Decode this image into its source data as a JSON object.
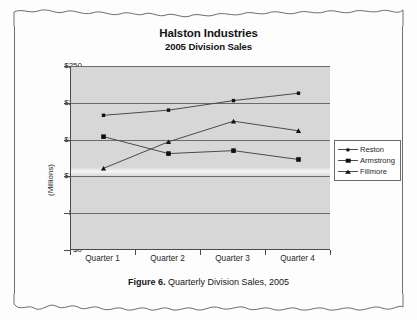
{
  "document": {
    "caption_label": "Figure 6.",
    "caption_text": "Quarterly Division Sales, 2005"
  },
  "chart_data": {
    "type": "line",
    "title": "Halston Industries",
    "subtitle": "2005 Division Sales",
    "xlabel": "",
    "ylabel": "(Millions)",
    "categories": [
      "Quarter 1",
      "Quarter 2",
      "Quarter 3",
      "Quarter 4"
    ],
    "ylim": [
      0,
      250
    ],
    "yticks": [
      0,
      50,
      100,
      150,
      200,
      250
    ],
    "ytick_labels": [
      "$0",
      "$50",
      "$100",
      "$150",
      "$200",
      "$250"
    ],
    "grid": true,
    "legend_position": "right",
    "series": [
      {
        "name": "Reston",
        "marker": "square-sm",
        "values": [
          183,
          190,
          203,
          213
        ]
      },
      {
        "name": "Armstrong",
        "marker": "square-lg",
        "values": [
          154,
          131,
          135,
          123
        ]
      },
      {
        "name": "Fillmore",
        "marker": "triangle",
        "values": [
          111,
          147,
          175,
          162
        ]
      }
    ],
    "colors": {
      "plot_background": "#d7d7d7",
      "gridline": "#6b6b6b",
      "axis": "#4a4a4a",
      "series_line": "#4a4a4a",
      "marker": "#111111",
      "page_background": "#fdfdfd"
    }
  }
}
